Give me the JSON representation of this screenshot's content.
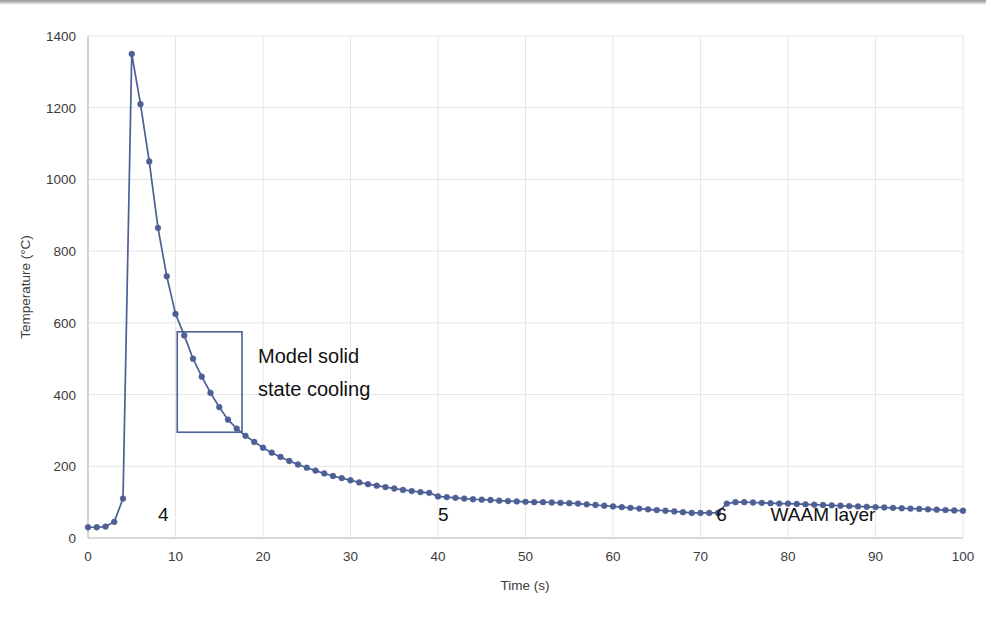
{
  "chart_data": {
    "type": "line",
    "title": "",
    "xlabel": "Time (s)",
    "ylabel": "Temperature (°C)",
    "xlim": [
      0,
      100
    ],
    "ylim": [
      0,
      1400
    ],
    "xticks": [
      0,
      10,
      20,
      30,
      40,
      50,
      60,
      70,
      80,
      90,
      100
    ],
    "yticks": [
      0,
      200,
      400,
      600,
      800,
      1000,
      1200,
      1400
    ],
    "grid": true,
    "legend": "none",
    "series": [
      {
        "name": "Thermal cycle",
        "color": "#4d5f94",
        "marker": "circle",
        "x": [
          0,
          1,
          2,
          3,
          4,
          5,
          6,
          7,
          8,
          9,
          10,
          11,
          12,
          13,
          14,
          15,
          16,
          17,
          18,
          19,
          20,
          21,
          22,
          23,
          24,
          25,
          26,
          27,
          28,
          29,
          30,
          31,
          32,
          33,
          34,
          35,
          36,
          37,
          38,
          39,
          40,
          41,
          42,
          43,
          44,
          45,
          46,
          47,
          48,
          49,
          50,
          51,
          52,
          53,
          54,
          55,
          56,
          57,
          58,
          59,
          60,
          61,
          62,
          63,
          64,
          65,
          66,
          67,
          68,
          69,
          70,
          71,
          72,
          73,
          74,
          75,
          76,
          77,
          78,
          79,
          80,
          81,
          82,
          83,
          84,
          85,
          86,
          87,
          88,
          89,
          90,
          91,
          92,
          93,
          94,
          95,
          96,
          97,
          98,
          99,
          100
        ],
        "y": [
          30,
          30,
          32,
          45,
          110,
          1350,
          1210,
          1050,
          865,
          730,
          625,
          565,
          500,
          450,
          405,
          365,
          330,
          305,
          285,
          268,
          252,
          238,
          226,
          215,
          205,
          196,
          188,
          180,
          173,
          167,
          161,
          155,
          150,
          146,
          142,
          138,
          134,
          131,
          128,
          126,
          116,
          114,
          112,
          110,
          108,
          107,
          106,
          104,
          103,
          102,
          101,
          100,
          100,
          99,
          98,
          97,
          96,
          94,
          92,
          90,
          88,
          86,
          84,
          82,
          80,
          78,
          76,
          74,
          72,
          70,
          70,
          70,
          70,
          96,
          100,
          100,
          99,
          98,
          97,
          96,
          96,
          95,
          94,
          93,
          92,
          91,
          90,
          89,
          88,
          87,
          86,
          85,
          84,
          83,
          82,
          81,
          80,
          79,
          78,
          77,
          76
        ]
      }
    ],
    "annotations": [
      {
        "name": "model-solid-state-cooling",
        "kind": "rect-with-label",
        "label_line1": "Model solid",
        "label_line2": "state cooling",
        "x_range": [
          10.2,
          17.6
        ],
        "y_range": [
          295,
          575
        ],
        "color": "#4d5f94"
      },
      {
        "name": "layer-4-label",
        "kind": "text",
        "text": "4",
        "x": 8.6,
        "y": 48
      },
      {
        "name": "layer-5-label",
        "kind": "text",
        "text": "5",
        "x": 40.6,
        "y": 48
      },
      {
        "name": "layer-6-label",
        "kind": "text",
        "text": "6",
        "x": 72.4,
        "y": 48
      },
      {
        "name": "waam-layer-label",
        "kind": "text",
        "text": "WAAM layer",
        "x": 84.0,
        "y": 48
      }
    ]
  },
  "style": {
    "plot_background": "#ffffff",
    "grid_color": "#e6e6e6",
    "axis_color": "#bfbfbf",
    "tick_text_color": "#3b3b3b",
    "series_color": "#4d5f94"
  }
}
